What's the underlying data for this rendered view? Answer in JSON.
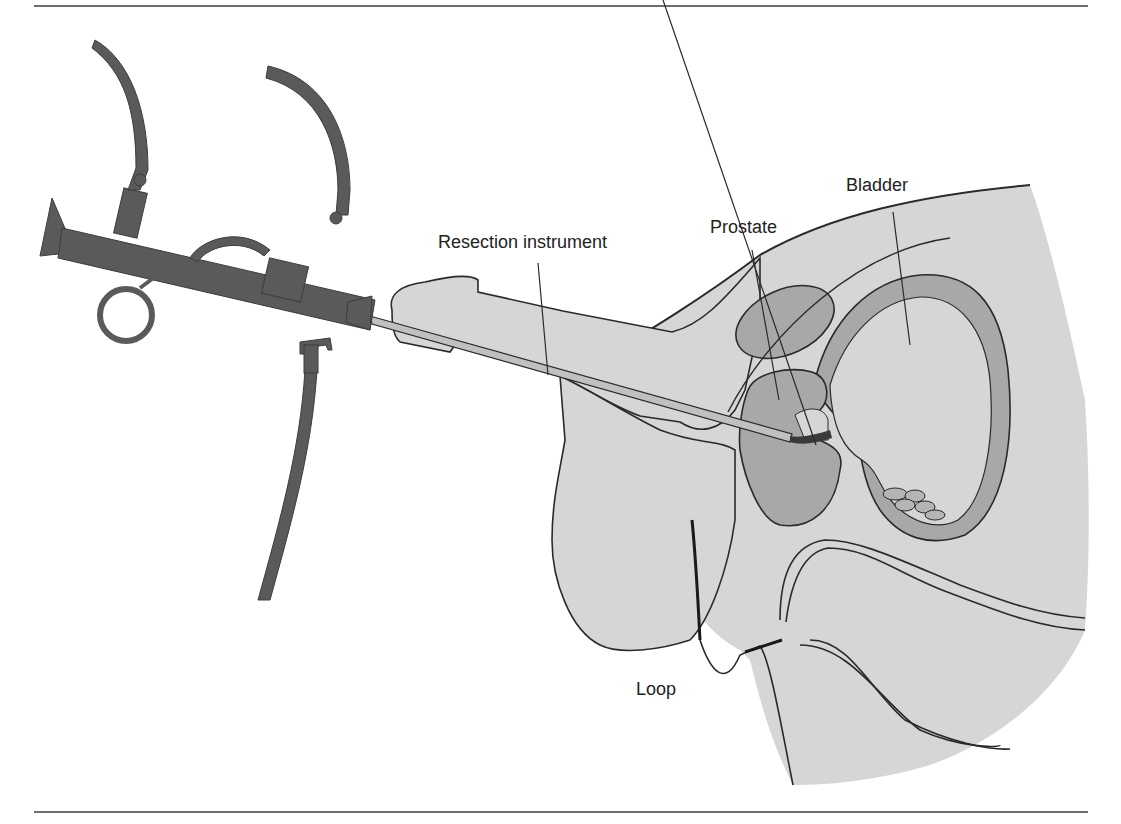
{
  "diagram": {
    "type": "anatomical-illustration",
    "labels": {
      "resection_instrument": "Resection instrument",
      "prostate": "Prostate",
      "bladder": "Bladder",
      "loop": "Loop"
    },
    "colors": {
      "instrument": "#5a5a5a",
      "tissue": "#d6d6d6",
      "organ": "#a8a8a8",
      "outline": "#2a2a2a",
      "loop_tip": "#3a3a3a",
      "rule": "#6e6e6e"
    }
  }
}
